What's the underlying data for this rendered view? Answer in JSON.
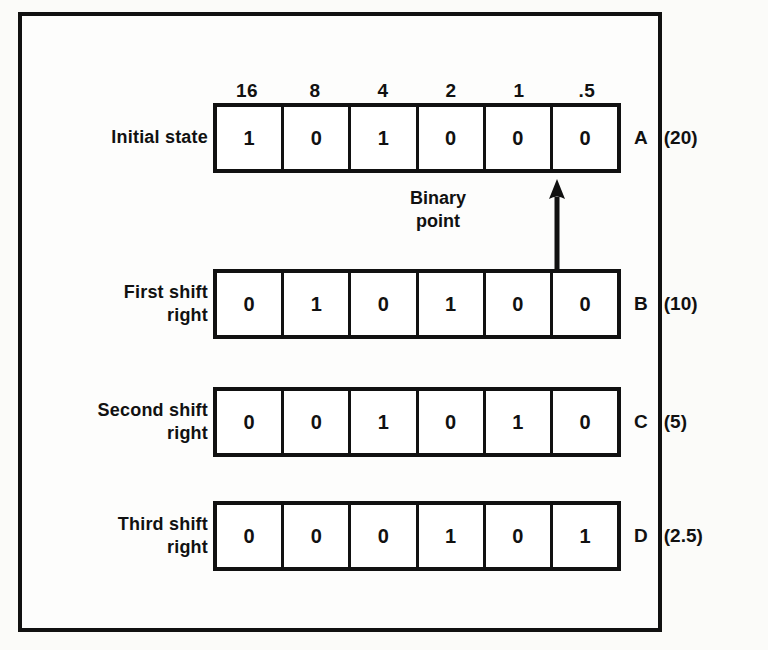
{
  "figure": {
    "caption_letters": [
      "A",
      "B",
      "C",
      "D"
    ],
    "bit_weights": [
      "16",
      "8",
      "4",
      "2",
      "1",
      ".5"
    ],
    "binary_point": {
      "label": "Binary\npoint",
      "arrow_icon": "up-arrow-icon",
      "points_between_columns": [
        5,
        6
      ]
    },
    "rows": [
      {
        "id": "A",
        "label": "Initial state",
        "bits": [
          "1",
          "0",
          "1",
          "0",
          "0",
          "0"
        ],
        "tag_letter": "A",
        "decimal_value": "(20)"
      },
      {
        "id": "B",
        "label": "First shift\nright",
        "bits": [
          "0",
          "1",
          "0",
          "1",
          "0",
          "0"
        ],
        "tag_letter": "B",
        "decimal_value": "(10)"
      },
      {
        "id": "C",
        "label": "Second shift\nright",
        "bits": [
          "0",
          "0",
          "1",
          "0",
          "1",
          "0"
        ],
        "tag_letter": "C",
        "decimal_value": "(5)"
      },
      {
        "id": "D",
        "label": "Third shift\nright",
        "bits": [
          "0",
          "0",
          "0",
          "1",
          "0",
          "1"
        ],
        "tag_letter": "D",
        "decimal_value": "(2.5)"
      }
    ]
  },
  "colors": {
    "ink": "#111111",
    "paper": "#fdfdfc",
    "page": "#fbfbf9",
    "showthrough": "#d9d7d2"
  },
  "background_showthrough": [
    " ",
    " ",
    " ",
    " ",
    " ",
    " ",
    " ",
    " ",
    " ",
    " ",
    " ",
    " "
  ]
}
